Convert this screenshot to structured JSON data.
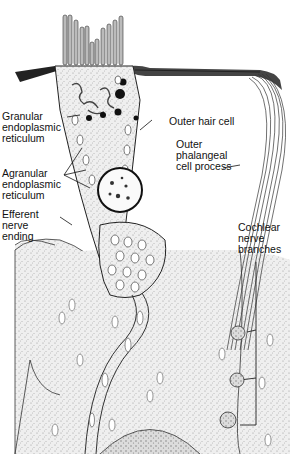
{
  "figure": {
    "style": "pen-and-ink stippled anatomical illustration",
    "colors": {
      "ink": "#1a1a1a",
      "stipple_fill": "#e4e4e4",
      "background": "#ffffff"
    }
  },
  "labels": [
    {
      "id": "granular-er",
      "text": "Granular\nendoplasmic\nreticulum"
    },
    {
      "id": "outer-hair-cell",
      "text": "Outer hair cell"
    },
    {
      "id": "outer-phalangeal",
      "text": "Outer\nphalangeal\ncell process"
    },
    {
      "id": "agranular-er",
      "text": "Agranular\nendoplasmic\nreticulum"
    },
    {
      "id": "efferent-nerve",
      "text": "Efferent\nnerve\nending"
    },
    {
      "id": "cochlear-nerve",
      "text": "Cochlear\nnerve\nbranches"
    }
  ]
}
